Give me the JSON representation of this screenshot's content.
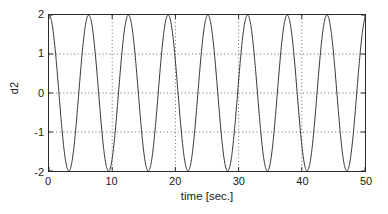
{
  "chart_data": {
    "type": "line",
    "title": "",
    "subtitle": "",
    "xlabel": "time [sec.]",
    "ylabel": "d2",
    "xlim": [
      0,
      50
    ],
    "ylim": [
      -2,
      2
    ],
    "xticks": [
      0,
      10,
      20,
      30,
      40,
      50
    ],
    "xtick_labels": [
      "0",
      "10",
      "20",
      "30",
      "40",
      "50"
    ],
    "yticks": [
      -2,
      -1,
      0,
      1,
      2
    ],
    "ytick_labels": [
      "-2",
      "-1",
      "0",
      "1",
      "2"
    ],
    "grid": true,
    "grid_style": "dotted",
    "grid_color": "#555555",
    "legend": null,
    "legend_position": "none",
    "line_color": "#333333",
    "line_width": 1.0,
    "background_color": "#ffffff",
    "axes_color": "#2a2a2a",
    "annotations": [],
    "series": [
      {
        "name": "d2",
        "amplitude": 2,
        "angular_frequency": 1.0,
        "period": 6.283,
        "phase_deg": 90,
        "cycles_visible": 8,
        "expression": "2*cos(t)",
        "samples": 1200
      }
    ]
  },
  "figure": {
    "width": 388,
    "height": 214
  }
}
